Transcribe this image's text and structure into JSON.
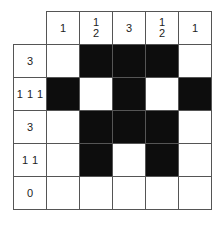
{
  "puzzle": {
    "type": "nonogram",
    "rows": 5,
    "cols": 5,
    "column_clues": [
      [
        "1"
      ],
      [
        "1",
        "2"
      ],
      [
        "3"
      ],
      [
        "1",
        "2"
      ],
      [
        "1"
      ]
    ],
    "row_clues": [
      [
        "3"
      ],
      [
        "1",
        "1",
        "1"
      ],
      [
        "3"
      ],
      [
        "1",
        "1"
      ],
      [
        "0"
      ]
    ],
    "grid": [
      [
        0,
        1,
        1,
        1,
        0
      ],
      [
        1,
        0,
        1,
        0,
        1
      ],
      [
        0,
        1,
        1,
        1,
        0
      ],
      [
        0,
        1,
        0,
        1,
        0
      ],
      [
        0,
        0,
        0,
        0,
        0
      ]
    ],
    "colors": {
      "filled": "#0d0d0d",
      "empty": "#ffffff",
      "border": "#555555"
    }
  }
}
